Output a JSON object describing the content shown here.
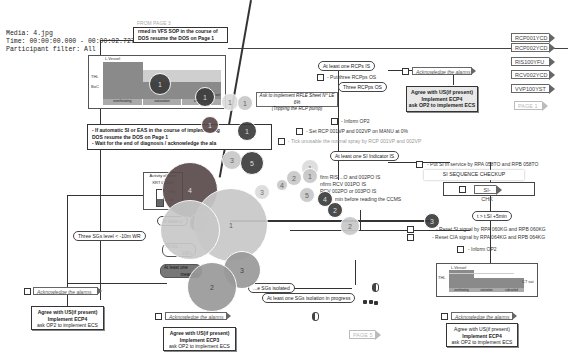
{
  "meta": {
    "media": "Media: 4.jpg",
    "time": "Time: 00:00:00.000 - 00:00:02.727",
    "participant": "Participant filter: All"
  },
  "top": {
    "from_page": "FROM PAGE 3",
    "vfs_note_line1": "rmed in VFS SOP in the course of",
    "vfs_note_line2": "DOS resume the DOS on Page 1"
  },
  "chart_top_left": {
    "y_label": "L.Vessel",
    "tick_high": "THL",
    "tick_low": "BoC",
    "segments": [
      "overheating",
      "saturation",
      "subcooled"
    ],
    "side_label": "set"
  },
  "rcp": {
    "at_least_one": "At least one RCPs IS",
    "put_three": "- Put three RCPps OS",
    "three_os": "Three RCPps OS",
    "ask_rfle_line1": "Ask to implement RFLE  Sheet N° LE 6%",
    "ask_rfle_line2": "(Tripping the RCP pump)",
    "inform_op2": "- Inform OP2",
    "set_rcp": "- Set  RCP 001VP and 002VP on MANU at 0%",
    "tick_unusable": "- Tick unusable the normal spray by RCP 001VP and 002VP"
  },
  "ack_top_right": {
    "ack": "Acknowledge the alarms",
    "agree_line1": "Agree with US(if present)",
    "agree_line2": "Implement ECP4",
    "agree_line3": "ask OP2 to implement ECS"
  },
  "tags": [
    {
      "label": "RCP001YCD"
    },
    {
      "label": "RCP002YCD"
    },
    {
      "label": "RIS100YFU"
    },
    {
      "label": "RCV002YCD"
    },
    {
      "label": "VVP100YST"
    },
    {
      "label": "PAGE 1"
    }
  ],
  "si_auto": {
    "line1": "- If automatic SI or EAS in the course of implementing",
    "line2": "DOS resume the DOS on Page 1",
    "line3": "- Wait for the end of diagnosis / acknowledge the ala"
  },
  "activity": {
    "title_line1": "Activity of zone",
    "title_line2": "KRT 022/32",
    "label_high": "mG",
    "label_low": "alt"
  },
  "si": {
    "at_least_one_si": "At least one SI Indicator IS",
    "confirm1": "firm RIS ...O and 002PO IS",
    "confirm2": "nfirm RCV 001PO  IS",
    "confirm3": "RCV 002PO or 003PO IS",
    "confirm4": "min before reading the CCMS",
    "put_si": "- Put SI in service by RPA 058TO and RPB 058TO",
    "seq_checkup": "SI SEQUENCE CHECKUP",
    "si_chk": "SI-CHK",
    "t_lsi": "t > t.SI +5min",
    "reset_si": "- Reset SI signal by RPA 060KG and RPB 060KG",
    "reset_cia": "- Reset CIA signal by RPA 064KG and RPB 064KG",
    "inform_op2": "- Inform OP2"
  },
  "left_flow": {
    "at_least_c": "At least c",
    "three_sgs": "Three SGs level < -10m WR",
    "at_least_small": "At lea...",
    "pct": "100 t",
    "at_least_one_dark_line1": "At least one",
    "at_least_one_dark_line2": "measure"
  },
  "sg": {
    "isolated": "...e SGs isolated",
    "in_progress": "At least one SGs isolation in progress"
  },
  "bottom_left": {
    "ack": "Acknowledge the alarms",
    "agree_line1": "Agree with US(if present)",
    "agree_line2": "Implement ECP4",
    "agree_line3": "ask OP2 to implement ECS"
  },
  "bottom_mid": {
    "ack": "Acknowledge the alarms",
    "agree_line1": "Agree with US(if present)",
    "agree_line2": "Implement ECP3",
    "agree_line3": "ask OP2 to implement ECS",
    "page": "PAGE 5"
  },
  "chart_bottom_right": {
    "y_label": "L.Vessel",
    "tick": "THL",
    "side_label": "CT sat",
    "segments": [
      "overheating",
      "saturation",
      "subcooled"
    ]
  },
  "bottom_right": {
    "ack": "Acknowledge the alarms",
    "agree_line1": "Agree with US(if present)",
    "agree_line2": "Implement ECP4",
    "agree_line3": "ask OP2 to implement ECS"
  },
  "fixations": [
    {
      "n": "1",
      "x": 160,
      "y": 84,
      "r": 11,
      "tone": "c-dark"
    },
    {
      "n": "1",
      "x": 205,
      "y": 97,
      "r": 10,
      "tone": "c-dark"
    },
    {
      "n": "1",
      "x": 230,
      "y": 102,
      "r": 9,
      "tone": "c-pale"
    },
    {
      "n": "1",
      "x": 245,
      "y": 103,
      "r": 8,
      "tone": "c-light"
    },
    {
      "n": "1",
      "x": 247,
      "y": 131,
      "r": 10,
      "tone": "c-dark"
    },
    {
      "n": "3",
      "x": 232,
      "y": 160,
      "r": 10,
      "tone": "c-light"
    },
    {
      "n": "5",
      "x": 252,
      "y": 163,
      "r": 12,
      "tone": "c-dark"
    },
    {
      "n": "1",
      "x": 210,
      "y": 125,
      "r": 9,
      "tone": "c-red"
    },
    {
      "n": "4",
      "x": 190,
      "y": 190,
      "r": 28,
      "tone": "c-red"
    },
    {
      "n": "1",
      "x": 199,
      "y": 223,
      "r": 10,
      "tone": "c-red"
    },
    {
      "n": "1",
      "x": 231,
      "y": 225,
      "r": 37,
      "tone": "c-light"
    },
    {
      "n": "",
      "x": 190,
      "y": 230,
      "r": 30,
      "tone": "c-light"
    },
    {
      "n": "3",
      "x": 242,
      "y": 270,
      "r": 19,
      "tone": "c-mid"
    },
    {
      "n": "2",
      "x": 212,
      "y": 287,
      "r": 25,
      "tone": "c-mid"
    },
    {
      "n": "1",
      "x": 310,
      "y": 168,
      "r": 9,
      "tone": "c-pale"
    },
    {
      "n": "2",
      "x": 294,
      "y": 178,
      "r": 8,
      "tone": "c-light"
    },
    {
      "n": "1",
      "x": 310,
      "y": 176,
      "r": 8,
      "tone": "c-light"
    },
    {
      "n": "5",
      "x": 307,
      "y": 195,
      "r": 8,
      "tone": "c-light"
    },
    {
      "n": "4",
      "x": 325,
      "y": 199,
      "r": 8,
      "tone": "c-dark"
    },
    {
      "n": "4",
      "x": 282,
      "y": 185,
      "r": 6,
      "tone": "c-light"
    },
    {
      "n": "3",
      "x": 262,
      "y": 192,
      "r": 8,
      "tone": "c-pale"
    },
    {
      "n": "2",
      "x": 335,
      "y": 210,
      "r": 8,
      "tone": "c-dark"
    },
    {
      "n": "2",
      "x": 350,
      "y": 226,
      "r": 10,
      "tone": "c-light"
    },
    {
      "n": "3",
      "x": 432,
      "y": 221,
      "r": 8,
      "tone": "c-dark"
    }
  ]
}
